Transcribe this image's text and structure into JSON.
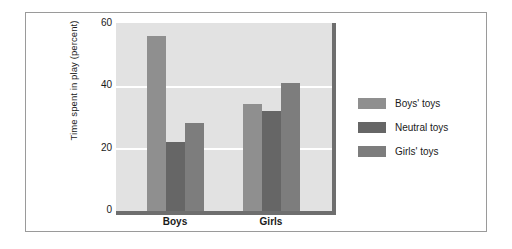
{
  "chart_data": {
    "type": "bar",
    "title": "",
    "xlabel": "",
    "ylabel": "Time spent in play (percent)",
    "categories": [
      "Boys",
      "Girls"
    ],
    "series": [
      {
        "name": "Boys' toys",
        "values": [
          56,
          34
        ],
        "color": "#8f8f8f"
      },
      {
        "name": "Neutral toys",
        "values": [
          22,
          32
        ],
        "color": "#666666"
      },
      {
        "name": "Girls' toys",
        "values": [
          28,
          41
        ],
        "color": "#7d7d7d"
      }
    ],
    "ylim": [
      0,
      60
    ],
    "yticks": [
      0,
      20,
      40,
      60
    ],
    "ytick_labels": [
      "0",
      "20",
      "40",
      "60"
    ],
    "grid": true,
    "grid_color": "#ffffff",
    "plot_background": "#e2e2e2",
    "axis_color": "#6e6e6e",
    "legend_position": "right",
    "frame_color": "#9a9a9a"
  },
  "axis": {
    "y_title": "Time spent in play (percent)",
    "tick_60": "60",
    "tick_40": "40",
    "tick_20": "20",
    "tick_0": "0",
    "cat_boys": "Boys",
    "cat_girls": "Girls"
  },
  "legend": {
    "item_0_label": "Boys' toys",
    "item_1_label": "Neutral toys",
    "item_2_label": "Girls' toys"
  }
}
